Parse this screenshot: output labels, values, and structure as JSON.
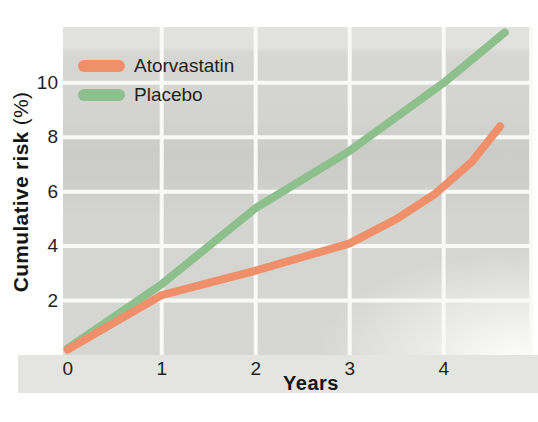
{
  "chart_data": {
    "type": "line",
    "title": "",
    "xlabel": "Years",
    "ylabel": "Cumulative risk",
    "ylabel_unit": "(%)",
    "xlim": [
      -0.05,
      4.95
    ],
    "ylim": [
      0,
      12.05
    ],
    "x_ticks": [
      0,
      1,
      2,
      3,
      4
    ],
    "y_ticks": [
      2,
      4,
      6,
      8,
      10
    ],
    "x_gridlines": [
      1,
      2,
      3,
      4,
      4.93
    ],
    "grid": "white gridlines on gray panel",
    "legend_position": "top-left",
    "series": [
      {
        "name": "Atorvastatin",
        "color": "#F0906A",
        "x": [
          0,
          1,
          1.5,
          2,
          2.5,
          3,
          3.5,
          3.9,
          4.3,
          4.6
        ],
        "y": [
          0.2,
          2.2,
          2.65,
          3.1,
          3.6,
          4.1,
          5.0,
          5.9,
          7.1,
          8.4
        ]
      },
      {
        "name": "Placebo",
        "color": "#8EC08E",
        "x": [
          0,
          1,
          2,
          3,
          4,
          4.65
        ],
        "y": [
          0.25,
          2.6,
          5.4,
          7.5,
          10.0,
          11.85
        ]
      }
    ]
  },
  "style": {
    "panel_base": "#D5D6D2",
    "gridline_color": "#F9F9F7",
    "gridline_width": 4,
    "line_width": 8,
    "band_color": "#E4E5E0",
    "text_color": "#1F1F1D"
  }
}
